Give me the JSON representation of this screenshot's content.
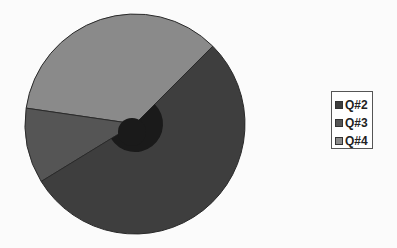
{
  "chart_data": {
    "type": "pie",
    "title": "",
    "categories": [
      "Q#2",
      "Q#3",
      "Q#4"
    ],
    "values": [
      53.8,
      11.1,
      35.1
    ],
    "colors": [
      "#3e3e3e",
      "#555555",
      "#8a8a8a"
    ],
    "legend_position": "right",
    "start_angle_deg": 45,
    "direction": "counterclockwise-from-Q#4",
    "slice_angles_math_deg": {
      "Q#4": [
        45,
        171.7
      ],
      "Q#3": [
        171.7,
        211.5
      ],
      "Q#2": [
        211.5,
        405
      ]
    },
    "inner_highlight_color": "#1a1a1a"
  },
  "legend": {
    "items": [
      {
        "label": "Q#2",
        "color": "#3e3e3e"
      },
      {
        "label": "Q#3",
        "color": "#555555"
      },
      {
        "label": "Q#4",
        "color": "#8a8a8a"
      }
    ]
  }
}
